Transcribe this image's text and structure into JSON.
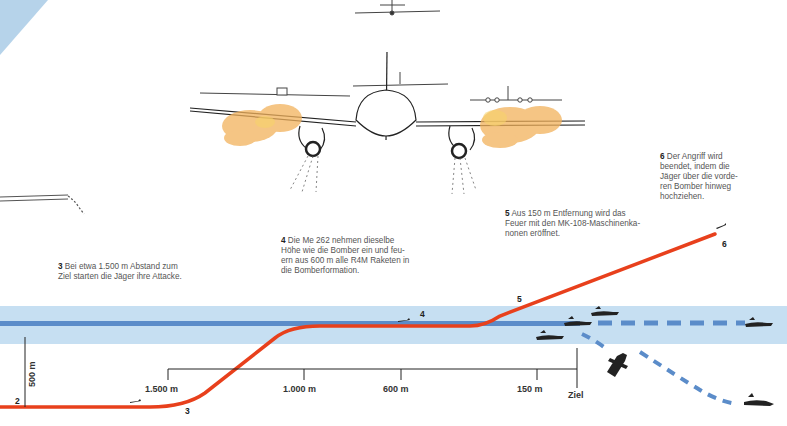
{
  "diagram": {
    "type": "attack-profile",
    "colors": {
      "attack_path": "#e8401c",
      "altitude_band": "#c6dff2",
      "formation_line": "#5b8cc9",
      "dashed_path": "#5b8cc9",
      "smoke": "#f2b25c",
      "ink": "#222222"
    }
  },
  "captions": [
    {
      "num": "3",
      "text": "Bei etwa 1.500 m Abstand zum Ziel starten die Jäger ihre Attacke."
    },
    {
      "num": "4",
      "text": "Die Me 262 nehmen dieselbe Höhe wie die Bomber ein und feuern aus 600 m alle R4M Raketen in die Bomberformation."
    },
    {
      "num": "5",
      "text": "Aus 150 m Entfernung wird das Feuer mit den MK-108-Maschinenkanonen eröffnet."
    },
    {
      "num": "6",
      "text": "Der Angriff wird beendet, indem die Jäger über die vorderen Bomber hinweg hochziehen."
    }
  ],
  "caption_lines": {
    "c3": [
      "Bei etwa 1.500 m Abstand zum",
      "Ziel starten die Jäger ihre Attacke."
    ],
    "c4": [
      "Die Me 262 nehmen dieselbe",
      "Höhe wie die Bomber ein und feu-",
      "ern aus 600 m alle R4M Raketen in",
      "die Bomberformation."
    ],
    "c5": [
      "Aus 150 m Entfernung wird das",
      "Feuer mit den MK-108-Maschinenka-",
      "nonen eröffnet."
    ],
    "c6": [
      "Der Angriff wird",
      "beendet, indem die",
      "Jäger über die vorde-",
      "ren Bomber hinweg",
      "hochziehen."
    ]
  },
  "path_markers": [
    "2",
    "3",
    "4",
    "5",
    "6"
  ],
  "scale": {
    "vertical_label": "500 m",
    "ticks": [
      "1.500 m",
      "1.000 m",
      "600 m",
      "150 m"
    ],
    "target_label": "Ziel"
  }
}
